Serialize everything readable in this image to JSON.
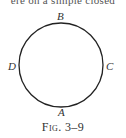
{
  "page": {
    "top_text_fragment": "ere on a simple closed"
  },
  "figure": {
    "shape": "circle",
    "stroke_color": "#222222",
    "center": [
      61,
      65
    ],
    "radius": 42,
    "points": [
      {
        "label": "A",
        "position": "bottom"
      },
      {
        "label": "B",
        "position": "top"
      },
      {
        "label": "C",
        "position": "right"
      },
      {
        "label": "D",
        "position": "left"
      }
    ],
    "caption": "Fig. 3–9"
  }
}
